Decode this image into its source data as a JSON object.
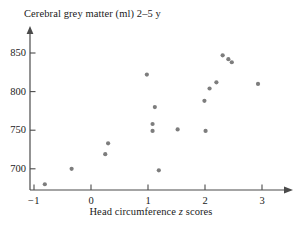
{
  "chart_data": {
    "type": "scatter",
    "title": "Cerebral grey matter (ml) 2–5 y",
    "xlabel": "Head circumference z scores",
    "xlabel_parts": {
      "before": "Head circumference ",
      "italic": "z",
      "after": " scores"
    },
    "ylabel": "",
    "xlim": [
      -1.35,
      3.35
    ],
    "ylim": [
      672,
      872
    ],
    "xticks": [
      -1,
      0,
      1,
      2,
      3
    ],
    "xtick_labels": [
      "−1",
      "0",
      "1",
      "2",
      "3"
    ],
    "yticks": [
      700,
      750,
      800,
      850
    ],
    "ytick_labels": [
      "700",
      "750",
      "800",
      "850"
    ],
    "grid": false,
    "legend": null,
    "marker": {
      "shape": "circle",
      "color": "#7d7d7d",
      "size_px": 4.2
    },
    "axis_color": "#4a4a4a",
    "axis_style": "arrow-ended L-frame, ticks inside-right on y, ticks above x",
    "n_points": 18,
    "points": [
      {
        "x": -0.81,
        "y": 680
      },
      {
        "x": -0.34,
        "y": 700
      },
      {
        "x": 0.25,
        "y": 719
      },
      {
        "x": 0.3,
        "y": 733
      },
      {
        "x": 0.98,
        "y": 822
      },
      {
        "x": 1.12,
        "y": 780
      },
      {
        "x": 1.08,
        "y": 758
      },
      {
        "x": 1.08,
        "y": 749
      },
      {
        "x": 1.19,
        "y": 698
      },
      {
        "x": 1.52,
        "y": 751
      },
      {
        "x": 1.99,
        "y": 788
      },
      {
        "x": 2.01,
        "y": 749
      },
      {
        "x": 2.08,
        "y": 804
      },
      {
        "x": 2.2,
        "y": 812
      },
      {
        "x": 2.31,
        "y": 847
      },
      {
        "x": 2.41,
        "y": 842
      },
      {
        "x": 2.47,
        "y": 838
      },
      {
        "x": 2.93,
        "y": 810
      }
    ]
  }
}
